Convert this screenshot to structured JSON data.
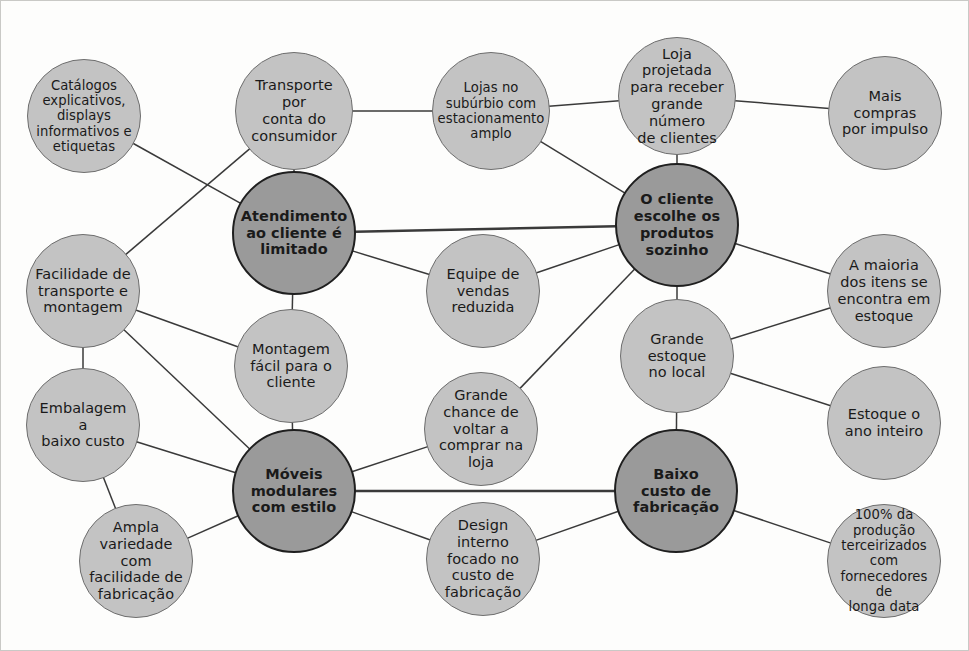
{
  "diagram": {
    "type": "node-link-cluster",
    "colors": {
      "hub_fill": "#9a9a9a",
      "hub_stroke": "#1f1f1f",
      "node_fill": "#c3c3c3",
      "node_stroke": "#6e6e6e",
      "edge": "#3a3a3a",
      "background": "#fdfdfc",
      "frame": "#c9c9c6"
    },
    "nodes": [
      {
        "id": "catalogos",
        "label": "Catálogos\nexplicativos,\ndisplays\ninformativos e\netiquetas",
        "kind": "light",
        "cx": 83,
        "cy": 115,
        "r": 57,
        "small": true
      },
      {
        "id": "transporte",
        "label": "Transporte por\nconta do\nconsumidor",
        "kind": "light",
        "cx": 293,
        "cy": 110,
        "r": 59,
        "small": false
      },
      {
        "id": "lojas-suburbio",
        "label": "Lojas no\nsubúrbio com\nestacionamento\namplo",
        "kind": "light",
        "cx": 490,
        "cy": 110,
        "r": 59,
        "small": true
      },
      {
        "id": "loja-projetada",
        "label": "Loja projetada\npara receber\ngrande número\nde clientes",
        "kind": "light",
        "cx": 676,
        "cy": 95,
        "r": 59,
        "small": false
      },
      {
        "id": "mais-compras",
        "label": "Mais\ncompras\npor impulso",
        "kind": "light",
        "cx": 884,
        "cy": 112,
        "r": 57,
        "small": false
      },
      {
        "id": "atendimento",
        "label": "Atendimento\nao cliente é\nlimitado",
        "kind": "hub",
        "cx": 293,
        "cy": 232,
        "r": 62,
        "small": false
      },
      {
        "id": "cliente-escolhe",
        "label": "O cliente\nescolhe os\nprodutos\nsozinho",
        "kind": "hub",
        "cx": 676,
        "cy": 224,
        "r": 62,
        "small": false
      },
      {
        "id": "facilidade",
        "label": "Facilidade de\ntransporte e\nmontagem",
        "kind": "light",
        "cx": 82,
        "cy": 290,
        "r": 57,
        "small": false
      },
      {
        "id": "equipe-vendas",
        "label": "Equipe de\nvendas\nreduzida",
        "kind": "light",
        "cx": 482,
        "cy": 290,
        "r": 57,
        "small": false
      },
      {
        "id": "a-maioria",
        "label": "A maioria\ndos itens se\nencontra em\nestoque",
        "kind": "light",
        "cx": 883,
        "cy": 290,
        "r": 57,
        "small": false
      },
      {
        "id": "montagem-facil",
        "label": "Montagem\nfácil para o\ncliente",
        "kind": "light",
        "cx": 290,
        "cy": 365,
        "r": 57,
        "small": false
      },
      {
        "id": "grande-estoque",
        "label": "Grande\nestoque\nno local",
        "kind": "light",
        "cx": 676,
        "cy": 355,
        "r": 57,
        "small": false
      },
      {
        "id": "embalagem",
        "label": "Embalagem a\nbaixo custo",
        "kind": "light",
        "cx": 82,
        "cy": 424,
        "r": 57,
        "small": false
      },
      {
        "id": "grande-chance",
        "label": "Grande\nchance de\nvoltar a\ncomprar na\nloja",
        "kind": "light",
        "cx": 480,
        "cy": 428,
        "r": 57,
        "small": false
      },
      {
        "id": "estoque-ano",
        "label": "Estoque o\nano inteiro",
        "kind": "light",
        "cx": 883,
        "cy": 422,
        "r": 57,
        "small": false
      },
      {
        "id": "moveis",
        "label": "Móveis\nmodulares\ncom estilo",
        "kind": "hub",
        "cx": 293,
        "cy": 490,
        "r": 62,
        "small": false
      },
      {
        "id": "baixo-custo",
        "label": "Baixo\ncusto de\nfabricação",
        "kind": "hub",
        "cx": 675,
        "cy": 490,
        "r": 62,
        "small": false
      },
      {
        "id": "ampla-variedade",
        "label": "Ampla\nvariedade com\nfacilidade de\nfabricação",
        "kind": "light",
        "cx": 135,
        "cy": 560,
        "r": 57,
        "small": false
      },
      {
        "id": "design-interno",
        "label": "Design\ninterno\nfocado no\ncusto de\nfabricação",
        "kind": "light",
        "cx": 482,
        "cy": 558,
        "r": 57,
        "small": false
      },
      {
        "id": "producao-100",
        "label": "100% da\nprodução\nterceirizados com\nfornecedores de\nlonga data",
        "kind": "light",
        "cx": 883,
        "cy": 560,
        "r": 57,
        "small": true
      }
    ],
    "edges": [
      {
        "from": "catalogos",
        "to": "atendimento"
      },
      {
        "from": "transporte",
        "to": "atendimento"
      },
      {
        "from": "transporte",
        "to": "facilidade"
      },
      {
        "from": "transporte",
        "to": "lojas-suburbio"
      },
      {
        "from": "lojas-suburbio",
        "to": "loja-projetada"
      },
      {
        "from": "lojas-suburbio",
        "to": "cliente-escolhe"
      },
      {
        "from": "loja-projetada",
        "to": "mais-compras"
      },
      {
        "from": "loja-projetada",
        "to": "cliente-escolhe"
      },
      {
        "from": "atendimento",
        "to": "cliente-escolhe"
      },
      {
        "from": "atendimento",
        "to": "equipe-vendas"
      },
      {
        "from": "atendimento",
        "to": "montagem-facil"
      },
      {
        "from": "facilidade",
        "to": "embalagem"
      },
      {
        "from": "facilidade",
        "to": "montagem-facil"
      },
      {
        "from": "facilidade",
        "to": "moveis"
      },
      {
        "from": "equipe-vendas",
        "to": "cliente-escolhe"
      },
      {
        "from": "cliente-escolhe",
        "to": "a-maioria"
      },
      {
        "from": "cliente-escolhe",
        "to": "grande-estoque"
      },
      {
        "from": "cliente-escolhe",
        "to": "grande-chance"
      },
      {
        "from": "grande-estoque",
        "to": "a-maioria"
      },
      {
        "from": "grande-estoque",
        "to": "estoque-ano"
      },
      {
        "from": "grande-estoque",
        "to": "baixo-custo"
      },
      {
        "from": "embalagem",
        "to": "moveis"
      },
      {
        "from": "embalagem",
        "to": "ampla-variedade"
      },
      {
        "from": "grande-chance",
        "to": "moveis"
      },
      {
        "from": "moveis",
        "to": "baixo-custo"
      },
      {
        "from": "moveis",
        "to": "montagem-facil"
      },
      {
        "from": "moveis",
        "to": "ampla-variedade"
      },
      {
        "from": "moveis",
        "to": "design-interno"
      },
      {
        "from": "design-interno",
        "to": "baixo-custo"
      },
      {
        "from": "baixo-custo",
        "to": "producao-100"
      }
    ]
  }
}
